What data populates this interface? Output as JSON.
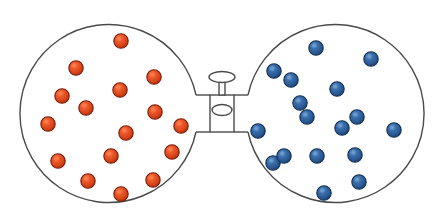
{
  "canvas": {
    "width": 442,
    "height": 223,
    "background": "#ffffff"
  },
  "diagram": {
    "type": "science-illustration",
    "outline_color": "#4a4a4a",
    "outline_width": 1.4,
    "fill_color": "#ffffff"
  },
  "left_flask": {
    "label": "left-flask",
    "center_x": 115,
    "center_y": 112,
    "radius": 89,
    "particle_color": "#d9431f",
    "particle_edge_color": "#7a1c08",
    "particle_highlight": "#ff7a4d",
    "particle_radius": 7.2,
    "particle_count": 16,
    "particles": [
      {
        "x": 121,
        "y": 41
      },
      {
        "x": 76,
        "y": 68
      },
      {
        "x": 154,
        "y": 77
      },
      {
        "x": 120,
        "y": 90
      },
      {
        "x": 86,
        "y": 108
      },
      {
        "x": 48,
        "y": 124
      },
      {
        "x": 155,
        "y": 112
      },
      {
        "x": 181,
        "y": 126
      },
      {
        "x": 126,
        "y": 133
      },
      {
        "x": 58,
        "y": 161
      },
      {
        "x": 111,
        "y": 156
      },
      {
        "x": 153,
        "y": 180
      },
      {
        "x": 88,
        "y": 181
      },
      {
        "x": 121,
        "y": 194
      },
      {
        "x": 172,
        "y": 152
      },
      {
        "x": 62,
        "y": 96
      }
    ]
  },
  "right_flask": {
    "label": "right-flask",
    "center_x": 330,
    "center_y": 113,
    "radius": 89,
    "particle_color": "#2a5f9e",
    "particle_edge_color": "#12304f",
    "particle_highlight": "#6f9ccf",
    "particle_radius": 7.2,
    "particle_count": 17,
    "particles": [
      {
        "x": 316,
        "y": 48
      },
      {
        "x": 371,
        "y": 59
      },
      {
        "x": 274,
        "y": 71
      },
      {
        "x": 291,
        "y": 80
      },
      {
        "x": 337,
        "y": 89
      },
      {
        "x": 307,
        "y": 117
      },
      {
        "x": 357,
        "y": 117
      },
      {
        "x": 258,
        "y": 131
      },
      {
        "x": 394,
        "y": 130
      },
      {
        "x": 273,
        "y": 163
      },
      {
        "x": 284,
        "y": 156
      },
      {
        "x": 317,
        "y": 156
      },
      {
        "x": 355,
        "y": 155
      },
      {
        "x": 359,
        "y": 182
      },
      {
        "x": 324,
        "y": 193
      },
      {
        "x": 342,
        "y": 128
      },
      {
        "x": 300,
        "y": 103
      }
    ]
  },
  "stopcock": {
    "label": "stopcock-valve",
    "state": "closed",
    "center_x": 222,
    "handle": {
      "cx": 222,
      "cy": 76,
      "rx": 13,
      "ry": 5.5
    },
    "stem": {
      "x": 219,
      "y": 81,
      "width": 6,
      "height": 14
    },
    "body": {
      "x": 210,
      "y": 95,
      "width": 24,
      "height": 37
    },
    "plug": {
      "cx": 222,
      "cy": 110,
      "rx": 10,
      "ry": 5.5
    },
    "upper_tube": {
      "left_x": 196,
      "right_x": 248,
      "y": 95,
      "inner_left_x": 210,
      "inner_right_x": 234
    },
    "lower_tube": {
      "left_x": 196,
      "right_x": 248,
      "y": 132,
      "inner_left_x": 210,
      "inner_right_x": 234
    },
    "outline_color": "#4a4a4a"
  }
}
